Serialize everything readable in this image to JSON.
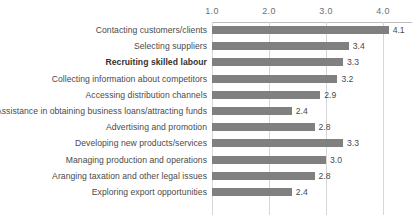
{
  "chart_data": {
    "type": "bar",
    "orientation": "horizontal",
    "title": "",
    "subtitle": "",
    "xlabel": "",
    "ylabel": "",
    "xlim": [
      1.0,
      4.2
    ],
    "xticks": [
      "1.0",
      "2.0",
      "3.0",
      "4.0"
    ],
    "xtick_values": [
      1.0,
      2.0,
      3.0,
      4.0
    ],
    "grid": true,
    "grid_axis": "x",
    "legend": false,
    "legend_position": "none",
    "bar_color": "#808080",
    "gridline_color": "#d6d6d6",
    "axis_color": "#bdbdbd",
    "label_color": "#4a4a4a",
    "categories": [
      "Contacting customers/clients",
      "Selecting suppliers",
      "Recruiting skilled labour",
      "Collecting information about competitors",
      "Accessing distribution channels",
      "Assistance in obtaining business loans/attracting funds",
      "Advertising and promotion",
      "Developing new products/services",
      "Managing production and operations",
      "Aranging taxation and other legal issues",
      "Exploring export opportunities"
    ],
    "values": [
      4.1,
      3.4,
      3.3,
      3.2,
      2.9,
      2.4,
      2.8,
      3.3,
      3.0,
      2.8,
      2.4
    ],
    "value_labels": [
      "4.1",
      "3.4",
      "3.3",
      "3.2",
      "2.9",
      "2.4",
      "2.8",
      "3.3",
      "3.0",
      "2.8",
      "2.4"
    ],
    "emphasized_categories": [
      "Recruiting skilled labour"
    ]
  }
}
